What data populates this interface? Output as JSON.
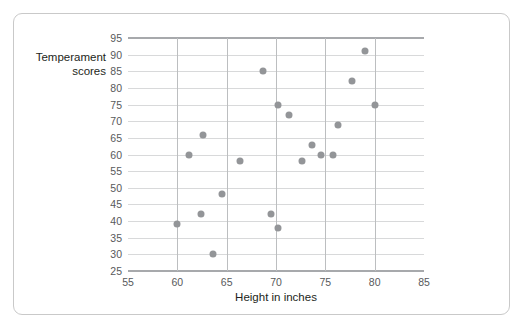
{
  "chart_data": {
    "type": "scatter",
    "title": "",
    "xlabel": "Height in inches",
    "ylabel": "Temperament scores",
    "xlim": [
      55,
      85
    ],
    "ylim": [
      25,
      95
    ],
    "x_ticks": [
      55,
      60,
      65,
      70,
      75,
      80,
      85
    ],
    "y_ticks": [
      25,
      30,
      35,
      40,
      45,
      50,
      55,
      60,
      65,
      70,
      75,
      80,
      85,
      90,
      95
    ],
    "grid": "horizontal-and-vertical",
    "legend": "none",
    "point_color": "#939598",
    "points": [
      {
        "x": 60.0,
        "y": 39
      },
      {
        "x": 61.2,
        "y": 60
      },
      {
        "x": 62.4,
        "y": 42
      },
      {
        "x": 62.6,
        "y": 66
      },
      {
        "x": 63.6,
        "y": 30
      },
      {
        "x": 64.5,
        "y": 48
      },
      {
        "x": 66.4,
        "y": 58
      },
      {
        "x": 68.7,
        "y": 85
      },
      {
        "x": 69.5,
        "y": 42
      },
      {
        "x": 70.2,
        "y": 75
      },
      {
        "x": 70.2,
        "y": 38
      },
      {
        "x": 71.3,
        "y": 72
      },
      {
        "x": 72.6,
        "y": 58
      },
      {
        "x": 73.6,
        "y": 63
      },
      {
        "x": 74.6,
        "y": 60
      },
      {
        "x": 75.8,
        "y": 60
      },
      {
        "x": 76.3,
        "y": 69
      },
      {
        "x": 77.7,
        "y": 82
      },
      {
        "x": 79.0,
        "y": 91
      },
      {
        "x": 80.0,
        "y": 75
      }
    ]
  }
}
